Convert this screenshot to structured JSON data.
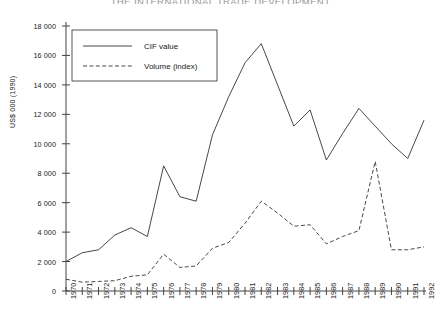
{
  "title": "THE INTERNATIONAL TRADE DEVELOPMENT",
  "axes": {
    "ylabel": "US$ 000 (1990)",
    "yticks": [
      "0",
      "2 000",
      "4 000",
      "6 000",
      "8 000",
      "10 000",
      "12 000",
      "14 000",
      "16 000",
      "18 000"
    ],
    "xticks": [
      "1970",
      "1971",
      "1972",
      "1973",
      "1974",
      "1975",
      "1976",
      "1977",
      "1978",
      "1979",
      "1980",
      "1981",
      "1982",
      "1983",
      "1984",
      "1985",
      "1986",
      "1987",
      "1988",
      "1989",
      "1990",
      "1991",
      "1992"
    ]
  },
  "legend": {
    "items": [
      {
        "label": "CIF value",
        "style": "solid"
      },
      {
        "label": "Volume (index)",
        "style": "dashed"
      }
    ]
  },
  "colors": {
    "line": "#333333",
    "axis": "#444444",
    "background": "#ffffff"
  },
  "chart_data": {
    "type": "line",
    "title": "THE INTERNATIONAL TRADE DEVELOPMENT",
    "xlabel": "",
    "ylabel": "US$ 000 (1990)",
    "x": [
      1970,
      1971,
      1972,
      1973,
      1974,
      1975,
      1976,
      1977,
      1978,
      1979,
      1980,
      1981,
      1982,
      1983,
      1984,
      1985,
      1986,
      1987,
      1988,
      1989,
      1990,
      1991,
      1992
    ],
    "xlim": [
      1970,
      1992
    ],
    "ylim": [
      0,
      18000
    ],
    "ytick_step": 2000,
    "grid": false,
    "legend_position": "upper-left",
    "series": [
      {
        "name": "CIF value",
        "style": "solid",
        "values": [
          2000,
          2600,
          2800,
          3800,
          4300,
          3700,
          8500,
          6400,
          6100,
          10600,
          13200,
          15500,
          16800,
          14000,
          11200,
          12300,
          8900,
          10700,
          12400,
          11200,
          10000,
          9000,
          11600
        ]
      },
      {
        "name": "Volume (index)",
        "style": "dashed",
        "values": [
          800,
          600,
          650,
          700,
          1000,
          1100,
          2500,
          1600,
          1700,
          2900,
          3300,
          4600,
          6100,
          5300,
          4400,
          4500,
          3200,
          3700,
          4100,
          8800,
          2800,
          2800,
          3000
        ]
      }
    ]
  }
}
